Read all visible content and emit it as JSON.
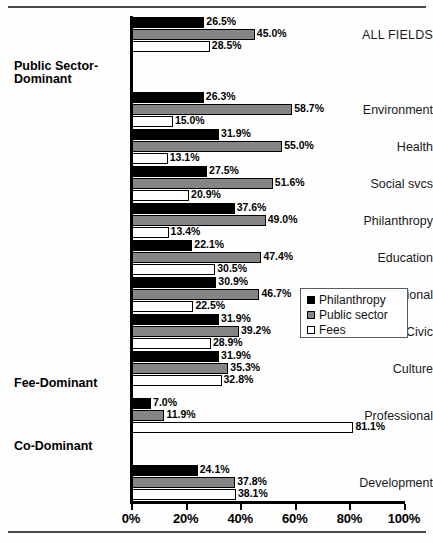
{
  "chart_data": {
    "type": "bar",
    "orientation": "horizontal",
    "title": "",
    "xlabel": "",
    "ylabel": "",
    "xlim": [
      0,
      100
    ],
    "grid": false,
    "legend_position": "center-right",
    "value_suffix": "%",
    "categories": [
      "ALL FIELDS",
      "Environment",
      "Health",
      "Social svcs",
      "Philanthropy",
      "Education",
      "International",
      "Civic",
      "Culture",
      "Professional",
      "Development"
    ],
    "series": [
      {
        "name": "Philanthropy",
        "color": "#000000",
        "values": [
          26.5,
          26.3,
          31.9,
          27.5,
          37.6,
          22.1,
          30.9,
          31.9,
          31.9,
          7.0,
          24.1
        ]
      },
      {
        "name": "Public sector",
        "color": "#858585",
        "values": [
          45.0,
          58.7,
          55.0,
          51.6,
          49.0,
          47.4,
          46.7,
          39.2,
          35.3,
          11.9,
          37.8
        ]
      },
      {
        "name": "Fees",
        "color": "#ffffff",
        "values": [
          28.5,
          15.0,
          13.1,
          20.9,
          13.4,
          30.5,
          22.5,
          28.9,
          32.8,
          81.1,
          38.1
        ]
      }
    ],
    "tick_labels": [
      "0%",
      "20%",
      "40%",
      "60%",
      "80%",
      "100%"
    ],
    "tick_values": [
      0,
      20,
      40,
      60,
      80,
      100
    ],
    "section_headers": [
      {
        "label": "Public Sector-",
        "label2": "Dominant"
      },
      {
        "label": "Fee-Dominant"
      },
      {
        "label": "Co-Dominant"
      }
    ]
  },
  "legend": {
    "items": [
      {
        "label": "Philanthropy",
        "swatch": "philanthropy"
      },
      {
        "label": "Public sector",
        "swatch": "public"
      },
      {
        "label": "Fees",
        "swatch": "fees"
      }
    ]
  },
  "groups": [
    {
      "name": "ALL FIELDS",
      "bold": false,
      "values": {
        "philanthropy": "26.5%",
        "public": "45.0%",
        "fees": "28.5%"
      }
    },
    {
      "name": "Environment",
      "bold": false,
      "values": {
        "philanthropy": "26.3%",
        "public": "58.7%",
        "fees": "15.0%"
      }
    },
    {
      "name": "Health",
      "bold": false,
      "values": {
        "philanthropy": "31.9%",
        "public": "55.0%",
        "fees": "13.1%"
      }
    },
    {
      "name": "Social svcs",
      "bold": false,
      "values": {
        "philanthropy": "27.5%",
        "public": "51.6%",
        "fees": "20.9%"
      }
    },
    {
      "name": "Philanthropy",
      "bold": false,
      "values": {
        "philanthropy": "37.6%",
        "public": "49.0%",
        "fees": "13.4%"
      }
    },
    {
      "name": "Education",
      "bold": false,
      "values": {
        "philanthropy": "22.1%",
        "public": "47.4%",
        "fees": "30.5%"
      }
    },
    {
      "name": "International",
      "bold": false,
      "values": {
        "philanthropy": "30.9%",
        "public": "46.7%",
        "fees": "22.5%"
      }
    },
    {
      "name": "Civic",
      "bold": false,
      "values": {
        "philanthropy": "31.9%",
        "public": "39.2%",
        "fees": "28.9%"
      }
    },
    {
      "name": "Culture",
      "bold": false,
      "values": {
        "philanthropy": "31.9%",
        "public": "35.3%",
        "fees": "32.8%"
      }
    },
    {
      "name": "Professional",
      "bold": false,
      "values": {
        "philanthropy": "7.0%",
        "public": "11.9%",
        "fees": "81.1%"
      }
    },
    {
      "name": "Development",
      "bold": false,
      "values": {
        "philanthropy": "24.1%",
        "public": "37.8%",
        "fees": "38.1%"
      }
    }
  ],
  "headers": {
    "public_sector_line1": "Public Sector-",
    "public_sector_line2": "Dominant",
    "fee_dominant": "Fee-Dominant",
    "co_dominant": "Co-Dominant"
  },
  "axis": {
    "ticks": [
      "0%",
      "20%",
      "40%",
      "60%",
      "80%",
      "100%"
    ]
  },
  "layout": {
    "plot_left_px": 131,
    "plot_right_px": 404,
    "px_per_percent": 2.73,
    "bar_height_px": 11,
    "group_tops_px": [
      17,
      92,
      129,
      166,
      203,
      240,
      277,
      314,
      351,
      398,
      465
    ],
    "header_tops_px": [
      60,
      377,
      440
    ],
    "header_indices": [
      1,
      9,
      10
    ]
  }
}
